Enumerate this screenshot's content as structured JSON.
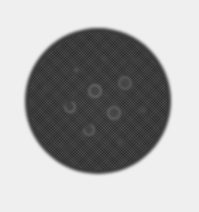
{
  "image": {
    "description": "Grayscale circular phantom disk with inserted spots",
    "background_color": "#efefef",
    "disk": {
      "cx": 98,
      "cy": 101,
      "r": 73,
      "color": "#383838"
    },
    "spots": [
      {
        "x": 76,
        "y": 70,
        "r": 4,
        "type": "solid",
        "color": "#5a5a5a"
      },
      {
        "x": 104,
        "y": 58,
        "r": 4,
        "type": "solid",
        "color": "#4a4a4a"
      },
      {
        "x": 95,
        "y": 91,
        "r": 7,
        "type": "ring",
        "color": "#6a6a6a"
      },
      {
        "x": 125,
        "y": 83,
        "r": 7,
        "type": "ring",
        "color": "#5e5e5e"
      },
      {
        "x": 70,
        "y": 107,
        "r": 6,
        "type": "c-shape",
        "color": "#6a6a6a"
      },
      {
        "x": 114,
        "y": 113,
        "r": 7,
        "type": "ring",
        "color": "#646464"
      },
      {
        "x": 89,
        "y": 130,
        "r": 6,
        "type": "c-shape",
        "color": "#686868"
      },
      {
        "x": 143,
        "y": 110,
        "r": 5,
        "type": "solid",
        "color": "#4e4e4e"
      },
      {
        "x": 120,
        "y": 142,
        "r": 5,
        "type": "solid",
        "color": "#4a4a4a"
      },
      {
        "x": 45,
        "y": 90,
        "r": 5,
        "type": "solid",
        "color": "#444444"
      },
      {
        "x": 62,
        "y": 145,
        "r": 5,
        "type": "solid",
        "color": "#424242"
      },
      {
        "x": 133,
        "y": 60,
        "r": 5,
        "type": "solid",
        "color": "#424242"
      }
    ]
  }
}
